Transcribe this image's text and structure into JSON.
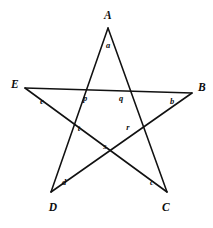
{
  "figure": {
    "type": "pentagram",
    "canvas": {
      "width": 213,
      "height": 228,
      "background": "#ffffff"
    },
    "stroke_color": "#111111",
    "label_color": "#0d0d0d",
    "vertices": [
      {
        "id": "A",
        "label": "A",
        "point": {
          "x": 108,
          "y": 28
        },
        "label_pos": {
          "x": 108,
          "y": 16
        }
      },
      {
        "id": "B",
        "label": "B",
        "point": {
          "x": 192,
          "y": 93
        },
        "label_pos": {
          "x": 202,
          "y": 88
        }
      },
      {
        "id": "C",
        "label": "C",
        "point": {
          "x": 167,
          "y": 192
        },
        "label_pos": {
          "x": 166,
          "y": 208
        }
      },
      {
        "id": "D",
        "label": "D",
        "point": {
          "x": 51,
          "y": 192
        },
        "label_pos": {
          "x": 53,
          "y": 208
        }
      },
      {
        "id": "E",
        "label": "E",
        "point": {
          "x": 25,
          "y": 88
        },
        "label_pos": {
          "x": 15,
          "y": 85
        }
      }
    ],
    "angle_labels": [
      {
        "id": "angle-a",
        "label": "a",
        "at_vertex": "A",
        "pos": {
          "x": 108,
          "y": 45
        }
      },
      {
        "id": "angle-b",
        "label": "b",
        "at_vertex": "B",
        "pos": {
          "x": 172,
          "y": 101
        }
      },
      {
        "id": "angle-c",
        "label": "c",
        "at_vertex": "C",
        "pos": {
          "x": 152,
          "y": 182
        }
      },
      {
        "id": "angle-d",
        "label": "d",
        "at_vertex": "D",
        "pos": {
          "x": 64,
          "y": 182
        }
      },
      {
        "id": "angle-e",
        "label": "e",
        "at_vertex": "E",
        "pos": {
          "x": 42,
          "y": 101
        }
      }
    ],
    "intersection_labels": [
      {
        "id": "node-p",
        "label": "p",
        "pos": {
          "x": 85,
          "y": 98
        }
      },
      {
        "id": "node-q",
        "label": "q",
        "pos": {
          "x": 121,
          "y": 98
        }
      },
      {
        "id": "node-r",
        "label": "r",
        "pos": {
          "x": 128,
          "y": 127
        }
      },
      {
        "id": "node-s",
        "label": "s",
        "pos": {
          "x": 105,
          "y": 146
        }
      },
      {
        "id": "node-t",
        "label": "t",
        "pos": {
          "x": 79,
          "y": 128
        }
      }
    ],
    "edges": [
      {
        "id": "edge-A-C",
        "from": "A",
        "to": "C"
      },
      {
        "id": "edge-C-E",
        "from": "C",
        "to": "E"
      },
      {
        "id": "edge-E-B",
        "from": "E",
        "to": "B"
      },
      {
        "id": "edge-B-D",
        "from": "B",
        "to": "D"
      },
      {
        "id": "edge-D-A",
        "from": "D",
        "to": "A"
      }
    ]
  }
}
